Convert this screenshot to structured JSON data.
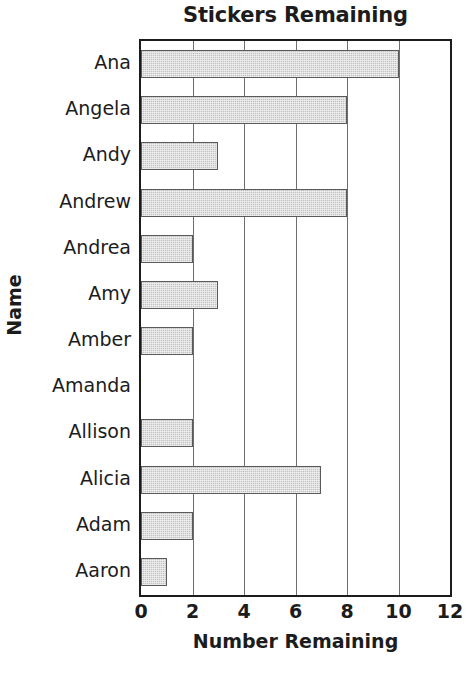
{
  "chart_data": {
    "type": "bar",
    "orientation": "horizontal",
    "title": "Stickers Remaining",
    "xlabel": "Number Remaining",
    "ylabel": "Name",
    "xlim": [
      0,
      12
    ],
    "xticks": [
      0,
      2,
      4,
      6,
      8,
      10,
      12
    ],
    "xtick_labels": [
      "0",
      "2",
      "4",
      "6",
      "8",
      "10",
      "12"
    ],
    "grid": true,
    "grid_axis": "x",
    "legend": false,
    "categories": [
      "Ana",
      "Angela",
      "Andy",
      "Andrew",
      "Andrea",
      "Amy",
      "Amber",
      "Amanda",
      "Allison",
      "Alicia",
      "Adam",
      "Aaron"
    ],
    "values": [
      10,
      8,
      3,
      8,
      2,
      3,
      2,
      0,
      2,
      7,
      2,
      1
    ],
    "bar_fill": "#c3c3c3",
    "bar_edge": "#5a5a5a",
    "axis_color": "#1c1c1c",
    "grid_color": "#6e6e6e",
    "background": "#ffffff"
  }
}
